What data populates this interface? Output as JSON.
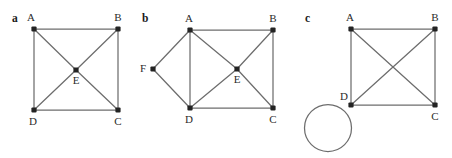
{
  "figure": {
    "width": 452,
    "height": 158,
    "background": "#ffffff",
    "edge_color": "#6d6d6d",
    "node_color": "#232323",
    "label_color": "#2b2b2b",
    "panel_letter_color": "#1a1a1a"
  },
  "panels": [
    {
      "id": "a",
      "letter": "a",
      "letter_pos": {
        "x": 12,
        "y": 22
      },
      "nodes": [
        {
          "id": "A",
          "label": "A",
          "x": 34,
          "y": 29,
          "label_x": 31,
          "label_y": 21,
          "anchor": "middle"
        },
        {
          "id": "B",
          "label": "B",
          "x": 118,
          "y": 29,
          "label_x": 118,
          "label_y": 21,
          "anchor": "middle"
        },
        {
          "id": "C",
          "label": "C",
          "x": 118,
          "y": 110,
          "label_x": 118,
          "label_y": 125,
          "anchor": "middle"
        },
        {
          "id": "D",
          "label": "D",
          "x": 34,
          "y": 110,
          "label_x": 33,
          "label_y": 125,
          "anchor": "middle"
        },
        {
          "id": "E",
          "label": "E",
          "x": 76,
          "y": 70,
          "label_x": 76,
          "label_y": 84,
          "anchor": "middle"
        }
      ],
      "edges": [
        {
          "from": "A",
          "to": "B"
        },
        {
          "from": "B",
          "to": "C"
        },
        {
          "from": "C",
          "to": "D"
        },
        {
          "from": "D",
          "to": "A"
        },
        {
          "from": "A",
          "to": "E"
        },
        {
          "from": "B",
          "to": "E"
        },
        {
          "from": "C",
          "to": "E"
        },
        {
          "from": "D",
          "to": "E"
        }
      ],
      "loops": []
    },
    {
      "id": "b",
      "letter": "b",
      "letter_pos": {
        "x": 142,
        "y": 22
      },
      "nodes": [
        {
          "id": "A",
          "label": "A",
          "x": 190,
          "y": 30,
          "label_x": 189,
          "label_y": 22,
          "anchor": "middle"
        },
        {
          "id": "B",
          "label": "B",
          "x": 273,
          "y": 30,
          "label_x": 273,
          "label_y": 22,
          "anchor": "middle"
        },
        {
          "id": "C",
          "label": "C",
          "x": 273,
          "y": 108,
          "label_x": 273,
          "label_y": 123,
          "anchor": "middle"
        },
        {
          "id": "D",
          "label": "D",
          "x": 190,
          "y": 108,
          "label_x": 189,
          "label_y": 123,
          "anchor": "middle"
        },
        {
          "id": "E",
          "label": "E",
          "x": 237,
          "y": 69,
          "label_x": 237,
          "label_y": 83,
          "anchor": "middle"
        },
        {
          "id": "F",
          "label": "F",
          "x": 153,
          "y": 69,
          "label_x": 146,
          "label_y": 72,
          "anchor": "end"
        }
      ],
      "edges": [
        {
          "from": "A",
          "to": "B"
        },
        {
          "from": "B",
          "to": "C"
        },
        {
          "from": "C",
          "to": "D"
        },
        {
          "from": "A",
          "to": "D"
        },
        {
          "from": "A",
          "to": "E"
        },
        {
          "from": "B",
          "to": "E"
        },
        {
          "from": "C",
          "to": "E"
        },
        {
          "from": "D",
          "to": "E"
        },
        {
          "from": "A",
          "to": "F"
        },
        {
          "from": "D",
          "to": "F"
        }
      ],
      "loops": []
    },
    {
      "id": "c",
      "letter": "c",
      "letter_pos": {
        "x": 305,
        "y": 22
      },
      "nodes": [
        {
          "id": "A",
          "label": "A",
          "x": 351,
          "y": 29,
          "label_x": 350,
          "label_y": 21,
          "anchor": "middle"
        },
        {
          "id": "B",
          "label": "B",
          "x": 435,
          "y": 29,
          "label_x": 435,
          "label_y": 21,
          "anchor": "middle"
        },
        {
          "id": "C",
          "label": "C",
          "x": 435,
          "y": 105,
          "label_x": 435,
          "label_y": 120,
          "anchor": "middle"
        },
        {
          "id": "D",
          "label": "D",
          "x": 351,
          "y": 105,
          "label_x": 344,
          "label_y": 100,
          "anchor": "middle"
        }
      ],
      "edges": [
        {
          "from": "A",
          "to": "B"
        },
        {
          "from": "B",
          "to": "C"
        },
        {
          "from": "C",
          "to": "D"
        },
        {
          "from": "A",
          "to": "D"
        },
        {
          "from": "A",
          "to": "C"
        },
        {
          "from": "B",
          "to": "D"
        }
      ],
      "loops": [
        {
          "at": "D",
          "cx": 328,
          "cy": 128,
          "r": 23.5
        }
      ]
    }
  ],
  "graph_summary": {
    "panel_a_degree_sequence": [
      3,
      3,
      3,
      3,
      4
    ],
    "panel_b_degree_sequence": [
      2,
      3,
      4,
      4,
      5,
      5
    ],
    "panel_c_degree_sequence": [
      3,
      3,
      3,
      5
    ]
  }
}
